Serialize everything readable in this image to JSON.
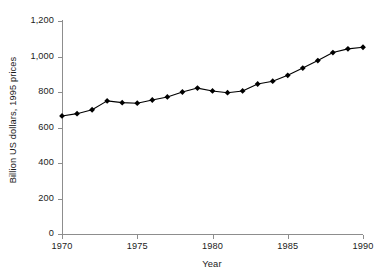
{
  "chart_data": {
    "type": "line",
    "title": "",
    "xlabel": "Year",
    "ylabel": "Billion US dollars, 1995 prices",
    "xlim": [
      1970,
      1990
    ],
    "ylim": [
      0,
      1200
    ],
    "grid": false,
    "legend": null,
    "marker": "diamond",
    "marker_color": "#000000",
    "line_color": "#000000",
    "xticks": [
      1970,
      1975,
      1980,
      1985,
      1990
    ],
    "xtick_labels": [
      "1970",
      "1975",
      "1980",
      "1985",
      "1990"
    ],
    "yticks": [
      0,
      200,
      400,
      600,
      800,
      1000,
      1200
    ],
    "ytick_labels": [
      "0",
      "200",
      "400",
      "600",
      "800",
      "1,000",
      "1,200"
    ],
    "x": [
      1970,
      1971,
      1972,
      1973,
      1974,
      1975,
      1976,
      1977,
      1978,
      1979,
      1980,
      1981,
      1982,
      1983,
      1984,
      1985,
      1986,
      1987,
      1988,
      1989,
      1990
    ],
    "values": [
      665,
      678,
      700,
      750,
      740,
      737,
      755,
      772,
      800,
      822,
      806,
      796,
      806,
      845,
      861,
      894,
      935,
      977,
      1022,
      1043,
      1052
    ],
    "series": [
      {
        "name": "Billion US dollars, 1995 prices",
        "values": [
          665,
          678,
          700,
          750,
          740,
          737,
          755,
          772,
          800,
          822,
          806,
          796,
          806,
          845,
          861,
          894,
          935,
          977,
          1022,
          1043,
          1052
        ]
      }
    ]
  }
}
